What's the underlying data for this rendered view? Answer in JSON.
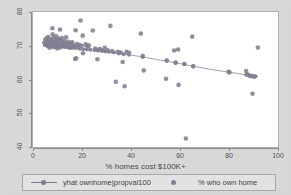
{
  "chart_data": {
    "type": "scatter",
    "title": "",
    "xlabel": "% homes cost $100K+",
    "ylabel": "",
    "xlim": [
      0,
      100
    ],
    "ylim": [
      40,
      80
    ],
    "xticks": [
      0,
      20,
      40,
      60,
      80,
      100
    ],
    "yticks": [
      40,
      50,
      60,
      70,
      80
    ],
    "grid": false,
    "legend_position": "bottom",
    "colors": {
      "marker": "#7f7f92",
      "line": "#7a7a8c",
      "plot_background": "#ffffff",
      "figure_background": "#d8d8d8",
      "axis": "#8a8a8a",
      "text": "#4a4a4a"
    },
    "series": [
      {
        "name": "% who own home",
        "type": "scatter",
        "marker": "circle",
        "points": [
          [
            4.6,
            70.9
          ],
          [
            5.0,
            71.8
          ],
          [
            5.2,
            70.3
          ],
          [
            5.5,
            72.2
          ],
          [
            5.8,
            71.1
          ],
          [
            6.0,
            69.9
          ],
          [
            6.2,
            72.6
          ],
          [
            6.4,
            70.6
          ],
          [
            6.6,
            71.4
          ],
          [
            6.8,
            69.4
          ],
          [
            7.0,
            71.0
          ],
          [
            7.2,
            72.0
          ],
          [
            7.4,
            70.2
          ],
          [
            7.6,
            71.6
          ],
          [
            7.8,
            69.8
          ],
          [
            8.0,
            73.4
          ],
          [
            8.1,
            70.8
          ],
          [
            8.3,
            71.2
          ],
          [
            8.5,
            72.4
          ],
          [
            8.7,
            69.6
          ],
          [
            8.9,
            70.5
          ],
          [
            9.1,
            71.9
          ],
          [
            9.3,
            70.1
          ],
          [
            9.5,
            72.8
          ],
          [
            9.7,
            71.3
          ],
          [
            9.9,
            69.2
          ],
          [
            10.1,
            70.7
          ],
          [
            10.3,
            71.5
          ],
          [
            10.5,
            72.1
          ],
          [
            10.8,
            70.0
          ],
          [
            11.0,
            71.7
          ],
          [
            11.2,
            69.5
          ],
          [
            11.5,
            70.4
          ],
          [
            11.8,
            72.3
          ],
          [
            12.0,
            71.1
          ],
          [
            12.3,
            69.9
          ],
          [
            12.6,
            70.9
          ],
          [
            12.9,
            71.4
          ],
          [
            13.2,
            70.2
          ],
          [
            13.5,
            72.5
          ],
          [
            13.8,
            69.7
          ],
          [
            14.1,
            70.6
          ],
          [
            14.4,
            71.2
          ],
          [
            14.8,
            70.3
          ],
          [
            15.2,
            69.4
          ],
          [
            15.6,
            70.8
          ],
          [
            16.0,
            71.0
          ],
          [
            16.4,
            70.1
          ],
          [
            16.8,
            69.6
          ],
          [
            17.2,
            66.1
          ],
          [
            17.6,
            66.3
          ],
          [
            18.0,
            70.5
          ],
          [
            18.4,
            69.8
          ],
          [
            18.9,
            70.2
          ],
          [
            19.4,
            77.5
          ],
          [
            19.9,
            70.0
          ],
          [
            20.4,
            67.8
          ],
          [
            7.9,
            75.2
          ],
          [
            11.0,
            74.8
          ],
          [
            17.4,
            74.6
          ],
          [
            20.3,
            73.0
          ],
          [
            21.5,
            70.4
          ],
          [
            22.2,
            69.7
          ],
          [
            22.8,
            70.1
          ],
          [
            24.4,
            74.5
          ],
          [
            25.4,
            69.2
          ],
          [
            26.3,
            66.0
          ],
          [
            26.8,
            68.8
          ],
          [
            27.3,
            69.0
          ],
          [
            28.5,
            68.6
          ],
          [
            29.3,
            69.4
          ],
          [
            30.4,
            68.7
          ],
          [
            31.6,
            75.9
          ],
          [
            32.3,
            68.4
          ],
          [
            33.8,
            59.3
          ],
          [
            34.6,
            68.2
          ],
          [
            35.8,
            68.0
          ],
          [
            36.6,
            65.2
          ],
          [
            37.4,
            58.0
          ],
          [
            38.2,
            68.2
          ],
          [
            39.2,
            67.9
          ],
          [
            44.0,
            73.6
          ],
          [
            44.8,
            67.0
          ],
          [
            45.2,
            62.7
          ],
          [
            54.3,
            60.2
          ],
          [
            54.6,
            65.6
          ],
          [
            57.6,
            68.6
          ],
          [
            58.2,
            65.0
          ],
          [
            61.8,
            64.6
          ],
          [
            62.4,
            42.5
          ],
          [
            65.0,
            72.7
          ],
          [
            65.4,
            63.9
          ],
          [
            59.2,
            68.9
          ],
          [
            59.4,
            58.4
          ],
          [
            79.8,
            62.3
          ],
          [
            80.2,
            62.1
          ],
          [
            87.0,
            62.5
          ],
          [
            87.6,
            61.5
          ],
          [
            88.4,
            61.1
          ],
          [
            89.2,
            61.0
          ],
          [
            90.3,
            60.8
          ],
          [
            89.6,
            55.8
          ],
          [
            91.8,
            69.5
          ]
        ]
      },
      {
        "name": "yhat ownhome|propval100",
        "type": "line",
        "fit": "linear",
        "points": [
          [
            4.6,
            70.2
          ],
          [
            10.0,
            69.8
          ],
          [
            15.0,
            69.4
          ],
          [
            20.0,
            69.0
          ],
          [
            25.0,
            68.6
          ],
          [
            30.0,
            68.2
          ],
          [
            35.0,
            67.7
          ],
          [
            40.0,
            67.2
          ],
          [
            45.0,
            66.7
          ],
          [
            50.0,
            66.0
          ],
          [
            55.0,
            65.4
          ],
          [
            60.0,
            64.7
          ],
          [
            65.0,
            64.0
          ],
          [
            70.0,
            63.3
          ],
          [
            75.0,
            62.7
          ],
          [
            80.0,
            62.2
          ],
          [
            85.0,
            61.6
          ],
          [
            90.0,
            61.0
          ],
          [
            91.8,
            60.8
          ]
        ],
        "marker_points": [
          [
            4.8,
            70.2
          ],
          [
            6.0,
            70.1
          ],
          [
            7.3,
            70.0
          ],
          [
            8.6,
            69.9
          ],
          [
            10.0,
            69.8
          ],
          [
            11.5,
            69.7
          ],
          [
            13.0,
            69.6
          ],
          [
            14.5,
            69.5
          ],
          [
            16.0,
            69.4
          ],
          [
            17.5,
            69.3
          ],
          [
            19.0,
            69.1
          ],
          [
            20.5,
            69.0
          ],
          [
            22.0,
            68.9
          ],
          [
            23.5,
            68.8
          ],
          [
            25.2,
            68.7
          ],
          [
            26.5,
            68.6
          ],
          [
            28.0,
            68.5
          ],
          [
            29.5,
            68.3
          ],
          [
            31.0,
            68.2
          ],
          [
            33.0,
            68.0
          ],
          [
            35.0,
            67.7
          ],
          [
            37.0,
            67.5
          ],
          [
            39.2,
            67.3
          ],
          [
            44.8,
            66.7
          ],
          [
            54.6,
            65.6
          ],
          [
            58.2,
            65.0
          ],
          [
            61.8,
            64.6
          ],
          [
            65.4,
            63.9
          ],
          [
            80.0,
            62.2
          ],
          [
            87.0,
            61.4
          ],
          [
            88.4,
            61.2
          ],
          [
            89.6,
            61.1
          ],
          [
            90.8,
            61.0
          ]
        ]
      }
    ]
  },
  "axis": {
    "x_title": "% homes cost $100K+",
    "x_tick_labels": [
      "0",
      "20",
      "40",
      "60",
      "80",
      "100"
    ],
    "y_tick_labels": [
      "40",
      "50",
      "60",
      "70",
      "80"
    ]
  },
  "legend": {
    "entries": [
      {
        "label": "yhat ownhome|propval100",
        "marker": "line-with-dot"
      },
      {
        "label": "% who own home",
        "marker": "dot"
      }
    ]
  }
}
